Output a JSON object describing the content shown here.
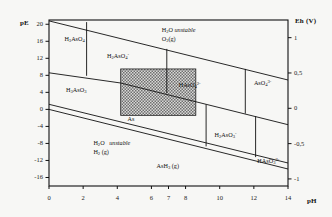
{
  "chart_data": {
    "type": "line",
    "title": "",
    "subtitle": "",
    "xlabel": "pH",
    "ylabel": "pE",
    "y2label": "Eh (V)",
    "xlim": [
      0,
      14
    ],
    "ylim": [
      -18,
      21
    ],
    "y2lim": [
      -1.1,
      1.25
    ],
    "grid": false,
    "legend_position": "none",
    "x_ticks": [
      "0",
      "2",
      "4",
      "6",
      "7",
      "8",
      "10",
      "12",
      "14"
    ],
    "x_tick_values": [
      0,
      2,
      4,
      6,
      7,
      8,
      10,
      12,
      14
    ],
    "y_ticks": [
      "20",
      "16",
      "12",
      "8",
      "4",
      "0",
      "-4",
      "-8",
      "-12",
      "-16"
    ],
    "y_tick_values": [
      20,
      16,
      12,
      8,
      4,
      0,
      -4,
      -8,
      -12,
      -16
    ],
    "y2_ticks": [
      "1",
      "0,5",
      "0",
      "-0,5",
      "-1"
    ],
    "y2_tick_values": [
      1,
      0.5,
      0,
      -0.5,
      -1
    ],
    "series": [
      {
        "name": "water-upper-stability-O2",
        "points": [
          [
            0,
            20.8
          ],
          [
            14,
            6.9
          ]
        ]
      },
      {
        "name": "water-lower-stability-H2",
        "points": [
          [
            0,
            0.0
          ],
          [
            14,
            -14.0
          ]
        ]
      },
      {
        "name": "as-metal-boundary-upper",
        "points": [
          [
            0,
            1.2
          ],
          [
            14,
            -12.6
          ]
        ]
      },
      {
        "name": "arsenate-arsenite-boundary",
        "points": [
          [
            0,
            8.6
          ],
          [
            4.2,
            6.2
          ],
          [
            9.2,
            1.2
          ],
          [
            14,
            -3.6
          ]
        ]
      },
      {
        "name": "h3aso4-h2aso4-vertical",
        "points": [
          [
            2.2,
            20.5
          ],
          [
            2.2,
            7.9
          ]
        ]
      },
      {
        "name": "h2aso4-haso4-vertical",
        "points": [
          [
            6.9,
            14.2
          ],
          [
            6.9,
            3.8
          ]
        ]
      },
      {
        "name": "haso4-aso4-vertical",
        "points": [
          [
            11.5,
            9.5
          ],
          [
            11.5,
            -1.0
          ]
        ]
      },
      {
        "name": "h3aso3-h2aso3-vertical",
        "points": [
          [
            9.2,
            1.2
          ],
          [
            9.2,
            -8.7
          ]
        ]
      },
      {
        "name": "h2aso3-haso3-vertical",
        "points": [
          [
            12.1,
            -1.6
          ],
          [
            12.1,
            -11.2
          ]
        ]
      }
    ],
    "shaded_region": {
      "name": "typical-natural-water-field",
      "x_range": [
        4.2,
        8.6
      ],
      "y_range": [
        -1.4,
        9.5
      ],
      "fill": "#8c8c8c",
      "pattern": "stipple"
    },
    "species_labels": [
      {
        "id": "h3aso4",
        "text_html": "H<sub>3</sub>AsO<sub>4</sub>",
        "x": 0.9,
        "y": 16.3
      },
      {
        "id": "h2aso4-minus",
        "text_html": "H<sub>2</sub>AsO<sub>4</sub><sup>-</sup>",
        "x": 3.4,
        "y": 12.3
      },
      {
        "id": "h3aso3",
        "text_html": "H<sub>3</sub>AsO<sub>3</sub>",
        "x": 1.0,
        "y": 4.3
      },
      {
        "id": "haso4-2minus",
        "text_html": "HAsO<sub>4</sub><sup>2-</sup>",
        "x": 7.6,
        "y": 5.6
      },
      {
        "id": "aso4-3minus",
        "text_html": "AsO<sub>4</sub><sup>3-</sup>",
        "x": 12.0,
        "y": 5.9
      },
      {
        "id": "h2aso3-minus",
        "text_html": "H<sub>2</sub>AsO<sub>3</sub><sup>-</sup>",
        "x": 9.7,
        "y": -6.2
      },
      {
        "id": "haso3-2minus",
        "text_html": "HAsO<sub>3</sub><sup>2-</sup>",
        "x": 12.2,
        "y": -12.3
      },
      {
        "id": "as-solid",
        "text_html": "As",
        "x": 4.6,
        "y": -2.4
      }
    ],
    "annotations": [
      {
        "id": "water-unstable-oxidizing",
        "line1_html": "H<sub>2</sub>O <i>unstable</i>",
        "line2_html": "O<sub>2</sub>(g)",
        "x": 6.6,
        "y": 18.6
      },
      {
        "id": "water-unstable-reducing",
        "line1_html": "H<sub>2</sub>O&nbsp;&nbsp; <i>unstable</i>",
        "line2_html": "H<sub>2</sub> (g)",
        "x": 2.6,
        "y": -8.0
      },
      {
        "id": "arsine-gas",
        "line1_html": "AsH<sub>3</sub> (g)",
        "line2_html": "",
        "x": 6.3,
        "y": -13.3
      }
    ]
  },
  "axes": {
    "y_left_title": "pE",
    "y_right_title": "Eh (V)",
    "x_title": "pH"
  }
}
